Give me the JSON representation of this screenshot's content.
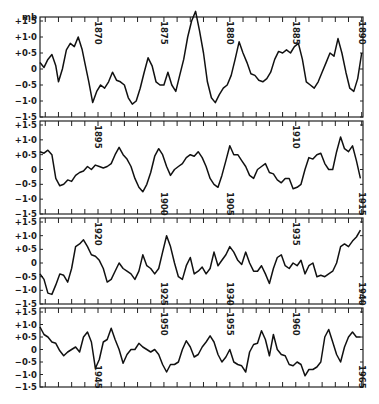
{
  "chart_data": {
    "type": "line",
    "title": "",
    "ylabel": "mb",
    "xlabel": "",
    "unit": "mb",
    "ylim": [
      -1.5,
      1.5
    ],
    "y_ticks": [
      "+1·5",
      "+1·0",
      "+0·5",
      "0",
      "−0·5",
      "−1·0",
      "−1·5"
    ],
    "grid": false,
    "legend": null,
    "panels": [
      {
        "range": [
          1865,
          1890
        ],
        "year_labels": [
          {
            "label": "1870",
            "year": 1870,
            "pos": "top"
          },
          {
            "label": "1875",
            "year": 1875,
            "pos": "top"
          },
          {
            "label": "1880",
            "year": 1880,
            "pos": "top"
          },
          {
            "label": "1885",
            "year": 1885,
            "pos": "top"
          },
          {
            "label": "1890",
            "year": 1890,
            "pos": "top"
          }
        ],
        "series": {
          "x": [
            1865.6,
            1865.9,
            1866.2,
            1866.5,
            1866.8,
            1867.0,
            1867.3,
            1867.6,
            1867.9,
            1868.2,
            1868.5,
            1868.8,
            1869.0,
            1869.3,
            1869.6,
            1869.9,
            1870.2,
            1870.5,
            1870.8,
            1871.1,
            1871.4,
            1871.7,
            1872.0,
            1872.3,
            1872.6,
            1872.9,
            1873.2,
            1873.5,
            1873.8,
            1874.1,
            1874.4,
            1874.7,
            1875.0,
            1875.3,
            1875.6,
            1875.9,
            1876.2,
            1876.5,
            1876.8,
            1877.1,
            1877.4,
            1877.7,
            1878.0,
            1878.3,
            1878.6,
            1878.9,
            1879.2,
            1879.5,
            1879.8,
            1880.1,
            1880.4,
            1880.7,
            1881.0,
            1881.3,
            1881.6,
            1881.9,
            1882.2,
            1882.5,
            1882.8,
            1883.1,
            1883.4,
            1883.7,
            1884.0,
            1884.3,
            1884.6,
            1884.9,
            1885.2,
            1885.5,
            1885.8,
            1886.1,
            1886.4,
            1886.7,
            1887.0,
            1887.3,
            1887.6,
            1887.9,
            1888.2,
            1888.5,
            1888.8,
            1889.1,
            1889.4,
            1889.7,
            1890.0
          ],
          "y": [
            0.2,
            0.05,
            0.3,
            0.45,
            0.1,
            -0.4,
            0.0,
            0.6,
            0.8,
            0.7,
            1.0,
            0.6,
            0.2,
            -0.4,
            -1.05,
            -0.7,
            -0.5,
            -0.6,
            -0.4,
            -0.1,
            -0.35,
            -0.4,
            -0.5,
            -0.9,
            -1.1,
            -1.0,
            -0.6,
            -0.1,
            0.35,
            0.1,
            -0.4,
            -0.5,
            -0.5,
            -0.1,
            -0.5,
            -0.7,
            -0.2,
            0.3,
            1.0,
            1.5,
            1.8,
            1.2,
            0.5,
            -0.4,
            -0.9,
            -1.05,
            -0.8,
            -0.6,
            -0.5,
            -0.2,
            0.3,
            0.85,
            0.5,
            0.2,
            -0.15,
            -0.2,
            -0.35,
            -0.4,
            -0.3,
            -0.1,
            0.3,
            0.55,
            0.5,
            0.6,
            0.5,
            0.7,
            0.8,
            0.3,
            -0.4,
            -0.5,
            -0.6,
            -0.4,
            -0.1,
            0.2,
            0.5,
            0.4,
            0.95,
            0.5,
            -0.1,
            -0.6,
            -0.7,
            -0.3,
            0.5
          ]
        }
      },
      {
        "range": [
          1890,
          1915
        ],
        "year_labels": [
          {
            "label": "1895",
            "year": 1895,
            "pos": "top"
          },
          {
            "label": "1900",
            "year": 1900,
            "pos": "bottom"
          },
          {
            "label": "1905",
            "year": 1905,
            "pos": "bottom"
          },
          {
            "label": "1910",
            "year": 1910,
            "pos": "top"
          },
          {
            "label": "1915",
            "year": 1915,
            "pos": "bottom"
          }
        ],
        "series": {
          "x": [
            1890.6,
            1890.9,
            1891.2,
            1891.5,
            1891.8,
            1892.1,
            1892.4,
            1892.7,
            1893.0,
            1893.3,
            1893.6,
            1893.9,
            1894.2,
            1894.5,
            1894.8,
            1895.1,
            1895.4,
            1895.7,
            1896.0,
            1896.3,
            1896.6,
            1896.9,
            1897.2,
            1897.5,
            1897.8,
            1898.1,
            1898.4,
            1898.7,
            1899.0,
            1899.3,
            1899.6,
            1899.9,
            1900.2,
            1900.5,
            1900.8,
            1901.1,
            1901.4,
            1901.7,
            1902.0,
            1902.3,
            1902.6,
            1902.9,
            1903.2,
            1903.5,
            1903.8,
            1904.1,
            1904.4,
            1904.7,
            1905.0,
            1905.3,
            1905.6,
            1905.9,
            1906.2,
            1906.5,
            1906.8,
            1907.1,
            1907.4,
            1907.7,
            1908.0,
            1908.3,
            1908.6,
            1908.9,
            1909.2,
            1909.5,
            1909.8,
            1910.1,
            1910.4,
            1910.7,
            1911.0,
            1911.3,
            1911.6,
            1911.9,
            1912.2,
            1912.5,
            1912.8,
            1913.1,
            1913.4,
            1913.7,
            1914.0,
            1914.3,
            1914.6,
            1914.9
          ],
          "y": [
            0.6,
            0.55,
            0.65,
            0.5,
            -0.3,
            -0.55,
            -0.5,
            -0.35,
            -0.4,
            -0.2,
            -0.1,
            -0.05,
            0.1,
            0.0,
            0.15,
            0.1,
            0.05,
            0.1,
            0.2,
            0.5,
            0.75,
            0.5,
            0.35,
            0.1,
            -0.3,
            -0.6,
            -0.75,
            -0.5,
            -0.1,
            0.45,
            0.7,
            0.5,
            0.1,
            -0.2,
            0.0,
            0.1,
            0.2,
            0.4,
            0.5,
            0.45,
            0.6,
            0.4,
            0.1,
            -0.3,
            -0.5,
            -0.6,
            -0.2,
            0.3,
            0.8,
            0.5,
            0.5,
            0.3,
            0.1,
            -0.2,
            -0.3,
            0.0,
            0.1,
            0.2,
            -0.1,
            -0.15,
            -0.35,
            -0.45,
            -0.3,
            -0.3,
            -0.65,
            -0.6,
            -0.5,
            0.0,
            0.4,
            0.35,
            0.5,
            0.55,
            0.2,
            0.0,
            0.0,
            0.6,
            1.1,
            0.7,
            0.6,
            0.8,
            0.3,
            -0.3
          ]
        }
      },
      {
        "range": [
          1915,
          1940
        ],
        "year_labels": [
          {
            "label": "1920",
            "year": 1920,
            "pos": "top"
          },
          {
            "label": "1925",
            "year": 1925,
            "pos": "bottom"
          },
          {
            "label": "1930",
            "year": 1930,
            "pos": "bottom"
          },
          {
            "label": "1935",
            "year": 1935,
            "pos": "top"
          },
          {
            "label": "1940",
            "year": 1940,
            "pos": "bottom"
          }
        ],
        "series": {
          "x": [
            1915.6,
            1915.9,
            1916.2,
            1916.5,
            1916.8,
            1917.1,
            1917.4,
            1917.7,
            1918.0,
            1918.3,
            1918.6,
            1918.9,
            1919.2,
            1919.5,
            1919.8,
            1920.1,
            1920.4,
            1920.7,
            1921.0,
            1921.3,
            1921.6,
            1921.9,
            1922.2,
            1922.5,
            1922.8,
            1923.1,
            1923.4,
            1923.7,
            1924.0,
            1924.3,
            1924.6,
            1924.9,
            1925.2,
            1925.5,
            1925.8,
            1926.1,
            1926.4,
            1926.7,
            1927.0,
            1927.3,
            1927.6,
            1927.9,
            1928.2,
            1928.5,
            1928.8,
            1929.1,
            1929.4,
            1929.7,
            1930.0,
            1930.3,
            1930.6,
            1930.9,
            1931.2,
            1931.5,
            1931.8,
            1932.1,
            1932.4,
            1932.7,
            1933.0,
            1933.3,
            1933.6,
            1933.9,
            1934.2,
            1934.5,
            1934.8,
            1935.1,
            1935.4,
            1935.7,
            1936.0,
            1936.3,
            1936.6,
            1936.9,
            1937.2,
            1937.5,
            1937.8,
            1938.1,
            1938.4,
            1938.7,
            1939.0,
            1939.3,
            1939.6,
            1939.9
          ],
          "y": [
            -0.4,
            -0.6,
            -1.1,
            -1.15,
            -0.8,
            -0.4,
            -0.45,
            -0.7,
            -0.2,
            0.6,
            0.7,
            0.85,
            0.6,
            0.3,
            0.25,
            0.1,
            -0.2,
            -0.7,
            -0.6,
            -0.3,
            0.0,
            -0.2,
            -0.3,
            -0.4,
            -0.6,
            -0.3,
            0.3,
            -0.1,
            -0.2,
            -0.4,
            -0.2,
            0.4,
            1.0,
            0.6,
            0.0,
            -0.5,
            -0.6,
            -0.1,
            0.2,
            -0.4,
            -0.3,
            -0.15,
            -0.4,
            -0.2,
            0.4,
            -0.1,
            0.1,
            0.3,
            0.6,
            0.4,
            0.1,
            -0.05,
            0.4,
            0.0,
            -0.3,
            -0.3,
            -0.1,
            -0.4,
            -0.75,
            -0.2,
            0.2,
            0.3,
            -0.1,
            -0.2,
            0.0,
            -0.1,
            0.1,
            -0.4,
            -0.1,
            0.0,
            -0.5,
            -0.45,
            -0.5,
            -0.4,
            -0.3,
            0.0,
            0.6,
            0.7,
            0.6,
            0.8,
            0.95,
            1.2
          ]
        }
      },
      {
        "range": [
          1940,
          1965
        ],
        "year_labels": [
          {
            "label": "1945",
            "year": 1945,
            "pos": "bottom"
          },
          {
            "label": "1950",
            "year": 1950,
            "pos": "top"
          },
          {
            "label": "1955",
            "year": 1955,
            "pos": "top"
          },
          {
            "label": "1960",
            "year": 1960,
            "pos": "top"
          },
          {
            "label": "1965",
            "year": 1965,
            "pos": "bottom"
          }
        ],
        "series": {
          "x": [
            1940.6,
            1940.9,
            1941.2,
            1941.5,
            1941.8,
            1942.1,
            1942.4,
            1942.7,
            1943.0,
            1943.3,
            1943.6,
            1943.9,
            1944.2,
            1944.5,
            1944.8,
            1945.1,
            1945.4,
            1945.7,
            1946.0,
            1946.3,
            1946.6,
            1946.9,
            1947.2,
            1947.5,
            1947.8,
            1948.1,
            1948.4,
            1948.7,
            1949.0,
            1949.3,
            1949.6,
            1949.9,
            1950.2,
            1950.5,
            1950.8,
            1951.1,
            1951.4,
            1951.7,
            1952.0,
            1952.3,
            1952.6,
            1952.9,
            1953.2,
            1953.5,
            1953.8,
            1954.1,
            1954.4,
            1954.7,
            1955.0,
            1955.3,
            1955.6,
            1955.9,
            1956.2,
            1956.5,
            1956.8,
            1957.1,
            1957.4,
            1957.7,
            1958.0,
            1958.3,
            1958.6,
            1958.9,
            1959.2,
            1959.5,
            1959.8,
            1960.1,
            1960.4,
            1960.7,
            1961.0,
            1961.3,
            1961.6,
            1961.9,
            1962.2,
            1962.5,
            1962.8,
            1963.1,
            1963.4,
            1963.7,
            1964.0,
            1964.3,
            1964.6,
            1964.9
          ],
          "y": [
            0.9,
            0.6,
            0.5,
            0.3,
            0.25,
            -0.05,
            -0.25,
            -0.1,
            0.0,
            0.1,
            -0.1,
            0.5,
            0.7,
            0.3,
            -0.75,
            -0.4,
            0.3,
            0.4,
            0.85,
            0.4,
            0.0,
            -0.55,
            -0.2,
            0.0,
            0.0,
            0.25,
            0.1,
            0.0,
            -0.1,
            0.0,
            -0.2,
            -0.6,
            -0.9,
            -0.6,
            -0.6,
            -0.5,
            0.0,
            0.35,
            0.1,
            -0.3,
            -0.2,
            0.1,
            0.3,
            0.55,
            0.3,
            -0.2,
            -0.5,
            -0.3,
            0.0,
            -0.5,
            -0.6,
            -0.65,
            -0.9,
            -0.1,
            0.2,
            0.25,
            0.75,
            0.4,
            -0.25,
            0.6,
            0.0,
            -0.2,
            -0.25,
            -0.6,
            -0.65,
            -0.5,
            -0.6,
            -1.05,
            -0.8,
            -0.8,
            -0.7,
            -0.5,
            0.5,
            0.8,
            0.3,
            -0.2,
            -0.5,
            0.1,
            0.5,
            0.7,
            0.5,
            0.5
          ]
        }
      }
    ]
  }
}
